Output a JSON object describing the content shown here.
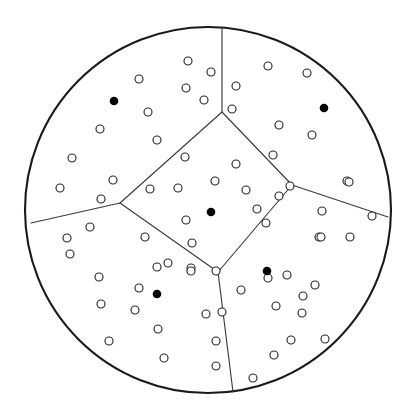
{
  "figure": {
    "name": "voronoi-tessellation-in-disk",
    "type": "geometric-diagram",
    "width": 412,
    "height": 411,
    "background_color": "#ffffff"
  },
  "style": {
    "boundary_stroke_color": "#1a1a1a",
    "boundary_stroke_width": 2.1,
    "edge_stroke_color": "#3a3a3a",
    "edge_stroke_width": 1.15,
    "open_point_stroke_color": "#2b2b2b",
    "open_point_stroke_width": 1.15,
    "open_point_fill": "#ffffff",
    "open_point_radius": 4.0,
    "seed_point_fill": "#000000",
    "seed_point_radius": 4.3
  },
  "boundary": {
    "shape": "circle",
    "cx": 208,
    "cy": 210,
    "r": 183
  },
  "vertices": {
    "top_junction": [
      222,
      112
    ],
    "left_junction": [
      120,
      203
    ],
    "right_junction": [
      292,
      185
    ],
    "bottom_junction": [
      218,
      272
    ],
    "top_rim": [
      222,
      27
    ],
    "left_rim": [
      31,
      223
    ],
    "right_rim": [
      388,
      217
    ],
    "bottom_rim": [
      233,
      392
    ]
  },
  "edges": [
    {
      "name": "edge-top-spoke",
      "from": [
        222,
        112
      ],
      "to": [
        222,
        27
      ]
    },
    {
      "name": "edge-left-spoke",
      "from": [
        120,
        203
      ],
      "to": [
        31,
        223
      ]
    },
    {
      "name": "edge-right-spoke",
      "from": [
        292,
        185
      ],
      "to": [
        388,
        217
      ]
    },
    {
      "name": "edge-bottom-spoke",
      "from": [
        218,
        272
      ],
      "to": [
        233,
        392
      ]
    },
    {
      "name": "edge-center-top-left",
      "from": [
        222,
        112
      ],
      "to": [
        120,
        203
      ]
    },
    {
      "name": "edge-center-top-right",
      "from": [
        222,
        112
      ],
      "to": [
        292,
        185
      ]
    },
    {
      "name": "edge-center-bottom-left",
      "from": [
        120,
        203
      ],
      "to": [
        218,
        272
      ]
    },
    {
      "name": "edge-center-bottom-right",
      "from": [
        292,
        185
      ],
      "to": [
        218,
        272
      ]
    }
  ],
  "cells": [
    {
      "name": "cell-top-left",
      "seed": [
        114,
        101
      ]
    },
    {
      "name": "cell-top-right",
      "seed": [
        324,
        108
      ]
    },
    {
      "name": "cell-center",
      "seed": [
        211,
        212
      ]
    },
    {
      "name": "cell-bottom-left",
      "seed": [
        157,
        294
      ]
    },
    {
      "name": "cell-bottom-right",
      "seed": [
        267,
        271
      ]
    }
  ],
  "seed_points": [
    [
      114,
      101
    ],
    [
      324,
      108
    ],
    [
      211,
      212
    ],
    [
      157,
      294
    ],
    [
      267,
      271
    ]
  ],
  "open_points": [
    [
      188,
      61
    ],
    [
      139,
      79
    ],
    [
      211,
      72
    ],
    [
      186,
      88
    ],
    [
      204,
      100
    ],
    [
      148,
      112
    ],
    [
      157,
      140
    ],
    [
      100,
      129
    ],
    [
      113,
      180
    ],
    [
      72,
      158
    ],
    [
      60,
      188
    ],
    [
      101,
      199
    ],
    [
      232,
      109
    ],
    [
      268,
      66
    ],
    [
      307,
      73
    ],
    [
      236,
      86
    ],
    [
      279,
      125
    ],
    [
      312,
      135
    ],
    [
      273,
      155
    ],
    [
      347,
      181
    ],
    [
      185,
      157
    ],
    [
      236,
      164
    ],
    [
      150,
      189
    ],
    [
      178,
      188
    ],
    [
      215,
      181
    ],
    [
      246,
      190
    ],
    [
      257,
      209
    ],
    [
      186,
      220
    ],
    [
      145,
      237
    ],
    [
      192,
      243
    ],
    [
      168,
      263
    ],
    [
      191,
      268
    ],
    [
      279,
      196
    ],
    [
      290,
      186
    ],
    [
      266,
      223
    ],
    [
      322,
      211
    ],
    [
      349,
      182
    ],
    [
      319,
      237
    ],
    [
      372,
      216
    ],
    [
      321,
      237
    ],
    [
      350,
      237
    ],
    [
      90,
      227
    ],
    [
      67,
      238
    ],
    [
      70,
      254
    ],
    [
      99,
      277
    ],
    [
      101,
      304
    ],
    [
      139,
      288
    ],
    [
      135,
      310
    ],
    [
      157,
      267
    ],
    [
      158,
      329
    ],
    [
      164,
      358
    ],
    [
      109,
      341
    ],
    [
      191,
      271
    ],
    [
      206,
      314
    ],
    [
      222,
      312
    ],
    [
      216,
      341
    ],
    [
      216,
      366
    ],
    [
      253,
      378
    ],
    [
      268,
      278
    ],
    [
      287,
      275
    ],
    [
      315,
      285
    ],
    [
      303,
      296
    ],
    [
      302,
      313
    ],
    [
      276,
      306
    ],
    [
      241,
      290
    ],
    [
      274,
      355
    ],
    [
      291,
      340
    ],
    [
      325,
      339
    ],
    [
      216,
      271
    ]
  ],
  "counts": {
    "cells": 5,
    "seed_points": 5,
    "open_points": 69
  }
}
